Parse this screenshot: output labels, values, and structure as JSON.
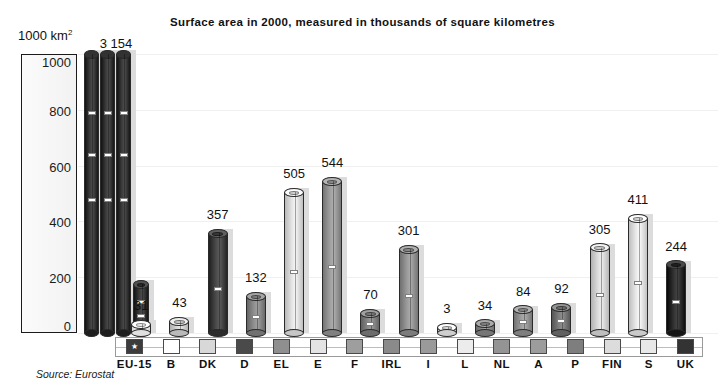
{
  "chart_data": {
    "type": "bar",
    "title": "Surface area in 2000, measured in thousands of square kilometres",
    "subtitle": "",
    "xlabel": "",
    "ylabel": "1000 km²",
    "ylim": [
      0,
      1000
    ],
    "yticks": [
      0,
      200,
      400,
      600,
      800,
      1000
    ],
    "ytick_labels": [
      "0",
      "200",
      "400",
      "600",
      "800",
      "1000"
    ],
    "grid": true,
    "legend_position": "bottom",
    "source": "Source: Eurostat",
    "note": "EU-15 total (3 154) exceeds the axis maximum and is drawn clipped at the top of the plot",
    "categories": [
      "EU-15",
      "B",
      "DK",
      "D",
      "EL",
      "E",
      "F",
      "IRL",
      "I",
      "L",
      "NL",
      "A",
      "P",
      "FIN",
      "S",
      "UK"
    ],
    "values": [
      3154,
      31,
      43,
      357,
      132,
      505,
      544,
      70,
      301,
      3,
      34,
      84,
      92,
      305,
      411,
      244
    ],
    "value_labels": [
      "3 154",
      "31",
      "43",
      "357",
      "132",
      "505",
      "544",
      "70",
      "301",
      "3",
      "34",
      "84",
      "92",
      "305",
      "411",
      "244"
    ],
    "colors": [
      "#3c3c3c",
      "#ffffff",
      "#d8d8d8",
      "#4a4a4a",
      "#8f8f8f",
      "#e4e4e4",
      "#9e9e9e",
      "#8a8a8a",
      "#9a9a9a",
      "#ececec",
      "#949494",
      "#9c9c9c",
      "#7e7e7e",
      "#dcdcdc",
      "#e8e8e8",
      "#333333"
    ],
    "clipped": [
      true,
      false,
      false,
      false,
      false,
      false,
      false,
      false,
      false,
      false,
      false,
      false,
      false,
      false,
      false,
      false
    ]
  },
  "axis": {
    "unit_base": "1000 km",
    "unit_sup": "2"
  },
  "legend": {
    "items": [
      {
        "label": "EU-15",
        "color": "#3c3c3c",
        "star": "★"
      },
      {
        "label": "B",
        "color": "#ffffff",
        "star": ""
      },
      {
        "label": "DK",
        "color": "#d8d8d8",
        "star": ""
      },
      {
        "label": "D",
        "color": "#4a4a4a",
        "star": ""
      },
      {
        "label": "EL",
        "color": "#8f8f8f",
        "star": ""
      },
      {
        "label": "E",
        "color": "#e4e4e4",
        "star": ""
      },
      {
        "label": "F",
        "color": "#9e9e9e",
        "star": ""
      },
      {
        "label": "IRL",
        "color": "#8a8a8a",
        "star": ""
      },
      {
        "label": "I",
        "color": "#9a9a9a",
        "star": ""
      },
      {
        "label": "L",
        "color": "#ececec",
        "star": ""
      },
      {
        "label": "NL",
        "color": "#949494",
        "star": ""
      },
      {
        "label": "A",
        "color": "#9c9c9c",
        "star": ""
      },
      {
        "label": "P",
        "color": "#7e7e7e",
        "star": ""
      },
      {
        "label": "FIN",
        "color": "#dcdcdc",
        "star": ""
      },
      {
        "label": "S",
        "color": "#e8e8e8",
        "star": ""
      },
      {
        "label": "UK",
        "color": "#333333",
        "star": ""
      }
    ]
  },
  "footer": {
    "source": "Source: Eurostat"
  }
}
